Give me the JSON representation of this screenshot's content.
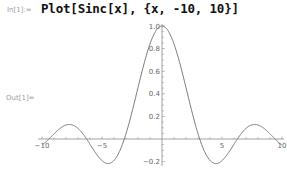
{
  "notebook": {
    "input_label": "In[1]:=",
    "input_code": "Plot[Sinc[x], {x, -10, 10}]",
    "output_label": "Out[1]="
  },
  "chart_data": {
    "type": "line",
    "title": "",
    "xlabel": "",
    "ylabel": "",
    "function": "Sinc[x]",
    "xlim": [
      -10,
      10
    ],
    "ylim": [
      -0.22,
      1.0
    ],
    "x_ticks": [
      -10,
      -5,
      5,
      10
    ],
    "x_tick_labels": [
      "-10",
      "-5",
      "5",
      "10"
    ],
    "y_ticks": [
      -0.2,
      0.2,
      0.4,
      0.6,
      0.8,
      1.0
    ],
    "y_tick_labels": [
      "-0.2",
      "0.2",
      "0.4",
      "0.6",
      "0.8",
      "1.0"
    ],
    "grid": false,
    "legend": null,
    "series": [
      {
        "name": "Sinc[x]",
        "color": "#5e81b5",
        "x": [
          -10,
          -9,
          -8,
          -7.725,
          -7,
          -6.283,
          -6,
          -5,
          -4.493,
          -4,
          -3.142,
          -3,
          -2,
          -1,
          0,
          1,
          2,
          3,
          3.142,
          4,
          4.493,
          5,
          6,
          6.283,
          7,
          7.725,
          8,
          9,
          10
        ],
        "y": [
          -0.054,
          0.046,
          0.124,
          0.128,
          0.094,
          0.0,
          -0.047,
          -0.192,
          -0.217,
          -0.189,
          0.0,
          0.047,
          0.455,
          0.841,
          1.0,
          0.841,
          0.455,
          0.047,
          0.0,
          -0.189,
          -0.217,
          -0.192,
          -0.047,
          0.0,
          0.094,
          0.128,
          0.124,
          0.046,
          -0.054
        ]
      }
    ]
  },
  "colors": {
    "curve": "#7a7a7a",
    "axes": "#8c8c8c",
    "labels": "#9aa0a6"
  }
}
